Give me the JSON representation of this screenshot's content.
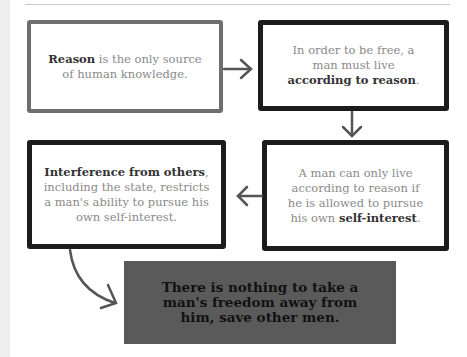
{
  "boxes": [
    {
      "id": "reason",
      "bold": "Reason",
      "text": " is the only source of human knowledge.",
      "border": "#6e6e6e"
    },
    {
      "id": "free",
      "pre": "In order to be free, a man must live ",
      "bold": "according to reason",
      "post": ".",
      "border": "#1c1c1c"
    },
    {
      "id": "selfinterest",
      "pre": "A man can only live according to reason if he is allowed to pursue his own ",
      "bold": "self-interest",
      "post": ".",
      "border": "#1c1c1c"
    },
    {
      "id": "interference",
      "bold": "Interference from others",
      "post": ", including the state, restricts a man's ability to pursue his own self-interest.",
      "border": "#1c1c1c"
    }
  ],
  "conclusion": {
    "text": "There is nothing to take a man's freedom away from him, save other men.",
    "background": "#5a5a5a"
  },
  "arrows": [
    {
      "from": "reason",
      "to": "free",
      "icon": "arrow-right-icon"
    },
    {
      "from": "free",
      "to": "selfinterest",
      "icon": "arrow-down-icon"
    },
    {
      "from": "selfinterest",
      "to": "interference",
      "icon": "arrow-left-icon"
    },
    {
      "from": "interference",
      "to": "conclusion",
      "icon": "curved-arrow-icon"
    }
  ]
}
